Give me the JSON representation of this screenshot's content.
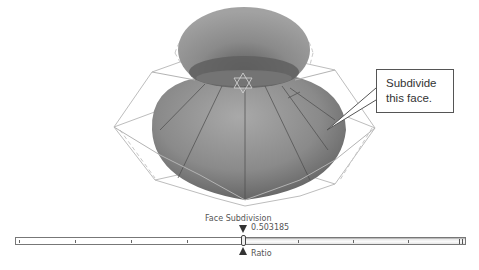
{
  "viewport": {
    "scene": "3D subdivision surface model (onion/vase shape) with wireframe control cage",
    "pivot_icon": "star-of-david-gizmo"
  },
  "callout": {
    "line1": "Subdivide",
    "line2": "this face."
  },
  "slider": {
    "title": "Face Subdivision",
    "value": "0.503185",
    "label": "Ratio",
    "ratio": 0.503185,
    "tick_count": 9,
    "colors": {
      "track_border": "#777777",
      "marker": "#333333",
      "fill": "#eeeeee"
    }
  }
}
